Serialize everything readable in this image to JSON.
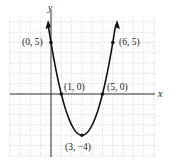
{
  "chart_data": {
    "type": "line",
    "title": "",
    "xlabel": "x",
    "ylabel": "y",
    "function": "y = (x - 1)(x - 5) = x^2 - 6x + 5",
    "grid": true,
    "xlim": [
      -4,
      10
    ],
    "ylim": [
      -6,
      7
    ],
    "series": [
      {
        "name": "parabola",
        "x": [
          -0.3,
          0,
          1,
          2,
          3,
          4,
          5,
          6,
          6.3
        ],
        "y": [
          6.9,
          5,
          0,
          -3,
          -4,
          -3,
          0,
          5,
          6.9
        ]
      }
    ],
    "points": [
      {
        "x": 0,
        "y": 5,
        "label": "(0, 5)"
      },
      {
        "x": 6,
        "y": 5,
        "label": "(6, 5)"
      },
      {
        "x": 1,
        "y": 0,
        "label": "(1, 0)"
      },
      {
        "x": 5,
        "y": 0,
        "label": "(5, 0)"
      },
      {
        "x": 3,
        "y": -4,
        "label": "(3, −4)"
      }
    ]
  },
  "labels": {
    "x_axis": "x",
    "y_axis": "y",
    "p05": "(0, 5)",
    "p65": "(6, 5)",
    "p10": "(1, 0)",
    "p50": "(5, 0)",
    "p34": "(3, −4)"
  },
  "colors": {
    "curve": "#111111",
    "axis": "#333333",
    "grid": "#c8c8c8"
  }
}
